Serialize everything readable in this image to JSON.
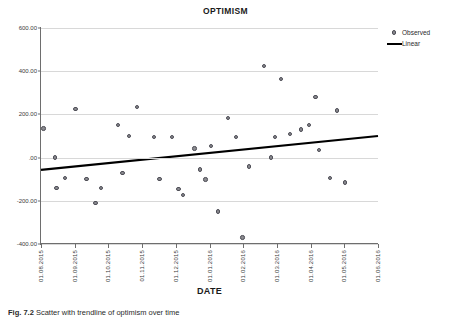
{
  "figure": {
    "caption_label": "Fig. 7.2",
    "caption_text": "Scatter with trendline of optimism over time"
  },
  "chart_data": {
    "type": "scatter",
    "title": "OPTIMISM",
    "xlabel": "DATE",
    "ylabel": "",
    "grid": true,
    "legend_position": "right",
    "ylim": [
      -400,
      600
    ],
    "yticks": [
      "600.00",
      "400.00",
      "200.00",
      ".00",
      "-200.00",
      "-400.00"
    ],
    "ytick_values": [
      600,
      400,
      200,
      0,
      -200,
      -400
    ],
    "xticks": [
      "01.08.2015",
      "01.09.2015",
      "01.10.2015",
      "01.11.2015",
      "01.12.2015",
      "01.01.2016",
      "01.02.2016",
      "01.03.2016",
      "01.04.2016",
      "01.05.2016",
      "01.06.2016"
    ],
    "xlim_months": [
      0,
      10
    ],
    "series": [
      {
        "name": "Observed",
        "type": "scatter",
        "marker": "circle",
        "color": "#8a8a8f",
        "points": [
          {
            "x": 0.07,
            "y": 135
          },
          {
            "x": 0.42,
            "y": 0
          },
          {
            "x": 0.46,
            "y": -140
          },
          {
            "x": 0.72,
            "y": -95
          },
          {
            "x": 1.02,
            "y": 225
          },
          {
            "x": 1.35,
            "y": -100
          },
          {
            "x": 1.62,
            "y": -210
          },
          {
            "x": 1.78,
            "y": -140
          },
          {
            "x": 2.28,
            "y": 150
          },
          {
            "x": 2.42,
            "y": -70
          },
          {
            "x": 2.62,
            "y": 100
          },
          {
            "x": 2.85,
            "y": 235
          },
          {
            "x": 3.35,
            "y": 95
          },
          {
            "x": 3.52,
            "y": -100
          },
          {
            "x": 3.88,
            "y": 95
          },
          {
            "x": 4.08,
            "y": -145
          },
          {
            "x": 4.22,
            "y": -172
          },
          {
            "x": 4.55,
            "y": 42
          },
          {
            "x": 4.72,
            "y": -55
          },
          {
            "x": 4.88,
            "y": -102
          },
          {
            "x": 5.05,
            "y": 55
          },
          {
            "x": 5.25,
            "y": -250
          },
          {
            "x": 5.55,
            "y": 182
          },
          {
            "x": 5.78,
            "y": 95
          },
          {
            "x": 5.98,
            "y": -370
          },
          {
            "x": 6.18,
            "y": -42
          },
          {
            "x": 6.62,
            "y": 425
          },
          {
            "x": 6.82,
            "y": 0
          },
          {
            "x": 6.95,
            "y": 95
          },
          {
            "x": 7.12,
            "y": 365
          },
          {
            "x": 7.38,
            "y": 108
          },
          {
            "x": 7.72,
            "y": 130
          },
          {
            "x": 7.95,
            "y": 152
          },
          {
            "x": 8.15,
            "y": 280
          },
          {
            "x": 8.25,
            "y": 35
          },
          {
            "x": 8.58,
            "y": -95
          },
          {
            "x": 8.78,
            "y": 218
          },
          {
            "x": 9.02,
            "y": -115
          }
        ]
      },
      {
        "name": "Linear",
        "type": "line",
        "color": "#000000",
        "fit": {
          "x_start": 0,
          "y_start": -57,
          "x_end": 10,
          "y_end": 100
        }
      }
    ]
  },
  "legend": {
    "items": [
      {
        "label": "Observed",
        "marker": "dot"
      },
      {
        "label": "Linear",
        "marker": "line"
      }
    ]
  }
}
